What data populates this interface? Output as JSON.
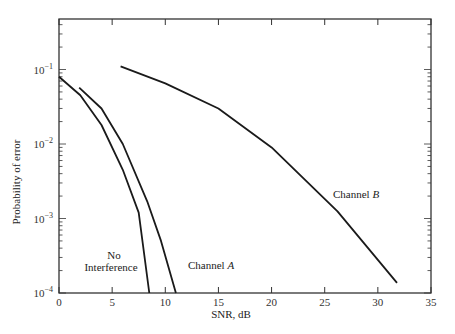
{
  "chart_data": {
    "type": "line",
    "title": "",
    "xlabel": "SNR, dB",
    "ylabel": "Probability of error",
    "xscale": "linear",
    "yscale": "log",
    "xlim": [
      0,
      35
    ],
    "ylim": [
      0.0001,
      0.5
    ],
    "grid": false,
    "legend": "inline labels",
    "x_ticks": [
      0,
      5,
      10,
      15,
      20,
      25,
      30,
      35
    ],
    "x_tick_labels": [
      "0",
      "5",
      "10",
      "15",
      "20",
      "25",
      "30",
      "35"
    ],
    "y_ticks": [
      0.1,
      0.01,
      0.001,
      0.0001
    ],
    "y_tick_labels": [
      {
        "base": "10",
        "exp": "−1"
      },
      {
        "base": "10",
        "exp": "−2"
      },
      {
        "base": "10",
        "exp": "−3"
      },
      {
        "base": "10",
        "exp": "−4"
      }
    ],
    "series": [
      {
        "name": "No Interference",
        "label_lines": [
          "No",
          "Interference"
        ],
        "points": [
          [
            0,
            0.08
          ],
          [
            2,
            0.045
          ],
          [
            4,
            0.018
          ],
          [
            6,
            0.0045
          ],
          [
            7.5,
            0.0012
          ],
          [
            8.5,
            0.0001
          ]
        ]
      },
      {
        "name": "Channel A",
        "label_text": "Channel ",
        "label_italic": "A",
        "points": [
          [
            1.9,
            0.057
          ],
          [
            4,
            0.03
          ],
          [
            6,
            0.01
          ],
          [
            8.3,
            0.0017
          ],
          [
            9.6,
            0.0005
          ],
          [
            11,
            0.0001
          ]
        ]
      },
      {
        "name": "Channel B",
        "label_text": "Channel ",
        "label_italic": "B",
        "points": [
          [
            5.8,
            0.11
          ],
          [
            10,
            0.065
          ],
          [
            15,
            0.03
          ],
          [
            20,
            0.009
          ],
          [
            26.2,
            0.00125
          ],
          [
            31.8,
            0.000137
          ]
        ]
      }
    ]
  },
  "colors": {
    "line": "#1a1a1a",
    "axis": "#333333",
    "background": "#ffffff"
  }
}
